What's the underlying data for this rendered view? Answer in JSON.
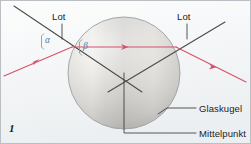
{
  "figure": {
    "number": "1",
    "caption_language": "de",
    "topic": "Lichtbrechung an einer Glaskugel",
    "background_color": "#f4f6f7",
    "border_color": "#b9bfc2"
  },
  "labels": {
    "lot_left": "Lot",
    "lot_right": "Lot",
    "glaskugel": "Glaskugel",
    "mittelpunkt": "Mittelpunkt"
  },
  "angles": {
    "alpha": "α",
    "beta": "β",
    "color": "#4f7fa8"
  },
  "colors": {
    "ray": "#d4536b",
    "normal_line": "#4a4a4a",
    "leader_line": "#3a3a3a",
    "sphere_outline": "#9aa0a3",
    "sphere_light": "#fbfbfa",
    "sphere_mid": "#d8d7d3",
    "sphere_shadow": "#b9b8b4"
  },
  "geometry": {
    "sphere": {
      "cx": 124,
      "cy": 73,
      "r": 56
    },
    "entry_point": {
      "x": 72,
      "y": 47
    },
    "exit_point": {
      "x": 176,
      "y": 47
    },
    "center_point": {
      "x": 124,
      "y": 73
    },
    "ray_in_start": {
      "x": 4,
      "y": 76
    },
    "ray_out_end": {
      "x": 246,
      "y": 82
    },
    "lot_left_line": {
      "x1": 14,
      "y1": 6,
      "x2": 142,
      "y2": 92
    },
    "lot_right_line": {
      "x1": 225,
      "y1": 22,
      "x2": 108,
      "y2": 92
    }
  },
  "leaders": {
    "lot_left_tick": {
      "x1": 62,
      "y1": 24,
      "x2": 62,
      "y2": 38
    },
    "lot_right_tick": {
      "x1": 187,
      "y1": 24,
      "x2": 187,
      "y2": 38
    },
    "glaskugel": {
      "points": "158,114 167,108 196,108"
    },
    "mittelpunkt": {
      "points": "124,73 124,133 196,133"
    }
  }
}
